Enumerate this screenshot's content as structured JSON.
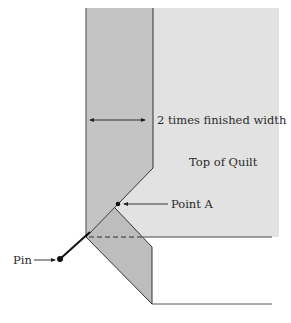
{
  "diagram": {
    "type": "quilt binding mitered corner illustration",
    "labels": {
      "width_note": "2 times finished width",
      "quilt_top": "Top of Quilt",
      "point_a": "Point A",
      "pin": "Pin"
    },
    "colors": {
      "quilt_top_fill": "#e2e2e2",
      "binding_fill": "#c4c4c4",
      "binding_fold_fill": "#bdbdbd",
      "line": "#333333",
      "background": "#ffffff"
    }
  }
}
